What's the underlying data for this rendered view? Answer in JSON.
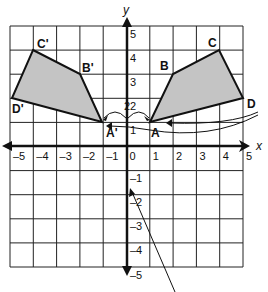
{
  "diagram": {
    "axes": {
      "x_label": "x",
      "y_label": "y",
      "x_ticks": [
        "-5",
        "-4",
        "-3",
        "-2",
        "-1",
        "0",
        "1",
        "2",
        "3",
        "4",
        "5"
      ],
      "y_ticks": [
        "5",
        "4",
        "3",
        "2",
        "1",
        "-1",
        "-2",
        "-3",
        "-4",
        "-5"
      ],
      "range": {
        "x": [
          -5,
          5
        ],
        "y": [
          -5,
          5
        ]
      }
    },
    "shapes": {
      "original": {
        "fill": "#c8c8c8",
        "vertices": [
          {
            "label": "A",
            "x": 1,
            "y": 1
          },
          {
            "label": "B",
            "x": 2,
            "y": 3
          },
          {
            "label": "C",
            "x": 4,
            "y": 4
          },
          {
            "label": "D",
            "x": 5,
            "y": 2
          }
        ]
      },
      "image": {
        "fill": "#c8c8c8",
        "vertices": [
          {
            "label": "A'",
            "x": -1,
            "y": 1
          },
          {
            "label": "B'",
            "x": -2,
            "y": 3
          },
          {
            "label": "C'",
            "x": -4,
            "y": 4
          },
          {
            "label": "D'",
            "x": -5,
            "y": 2
          }
        ]
      }
    },
    "annotations": {
      "distance_label": "2"
    }
  }
}
